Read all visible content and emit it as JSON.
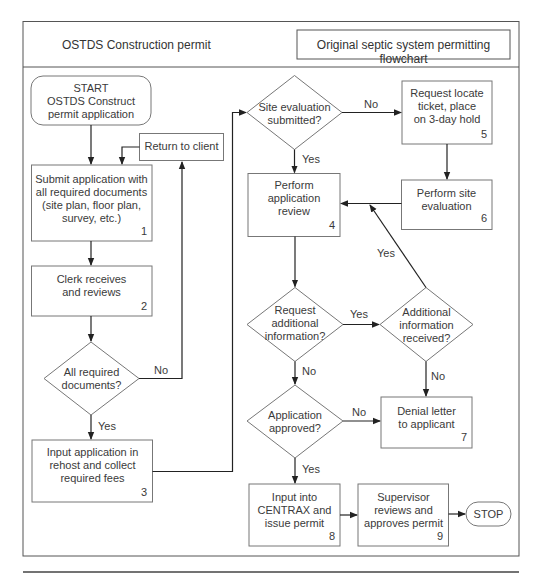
{
  "header": {
    "left_title": "OSTDS Construction permit",
    "right_title": "Original septic system permitting flowchart"
  },
  "nodes": {
    "start": {
      "shape": "terminator",
      "lines": [
        "START",
        "OSTDS Construct",
        "permit application"
      ]
    },
    "n1": {
      "shape": "process",
      "number": "1",
      "lines": [
        "Submit application with",
        "all required documents",
        "(site plan, floor plan,",
        "survey, etc.)"
      ]
    },
    "n2": {
      "shape": "process",
      "number": "2",
      "lines": [
        "Clerk receives",
        "and reviews"
      ]
    },
    "d_docs": {
      "shape": "decision",
      "lines": [
        "All required",
        "documents?"
      ]
    },
    "return": {
      "shape": "process",
      "lines": [
        "Return to client"
      ]
    },
    "n3": {
      "shape": "process",
      "number": "3",
      "lines": [
        "Input application in",
        "rehost and collect",
        "required fees"
      ]
    },
    "d_site": {
      "shape": "decision",
      "lines": [
        "Site evaluation",
        "submitted?"
      ]
    },
    "n5": {
      "shape": "process",
      "number": "5",
      "lines": [
        "Request locate",
        "ticket, place",
        "on 3-day hold"
      ]
    },
    "n6": {
      "shape": "process",
      "number": "6",
      "lines": [
        "Perform site",
        "evaluation"
      ]
    },
    "n4": {
      "shape": "process",
      "number": "4",
      "lines": [
        "Perform",
        "application",
        "review"
      ]
    },
    "d_request": {
      "shape": "decision",
      "lines": [
        "Request",
        "additional",
        "information?"
      ]
    },
    "d_received": {
      "shape": "decision",
      "lines": [
        "Additional",
        "information",
        "received?"
      ]
    },
    "d_approved": {
      "shape": "decision",
      "lines": [
        "Application",
        "approved?"
      ]
    },
    "n7": {
      "shape": "process",
      "number": "7",
      "lines": [
        "Denial letter",
        "to applicant"
      ]
    },
    "n8": {
      "shape": "process",
      "number": "8",
      "lines": [
        "Input into",
        "CENTRAX and",
        "issue permit"
      ]
    },
    "n9": {
      "shape": "process",
      "number": "9",
      "lines": [
        "Supervisor",
        "reviews and",
        "approves permit"
      ]
    },
    "stop": {
      "shape": "terminator",
      "lines": [
        "STOP"
      ]
    }
  },
  "edges": [
    {
      "from": "start",
      "to": "n1",
      "label": ""
    },
    {
      "from": "return",
      "to": "n1",
      "label": ""
    },
    {
      "from": "n1",
      "to": "n2",
      "label": ""
    },
    {
      "from": "n2",
      "to": "d_docs",
      "label": ""
    },
    {
      "from": "d_docs",
      "to": "return",
      "label": "No"
    },
    {
      "from": "d_docs",
      "to": "n3",
      "label": "Yes"
    },
    {
      "from": "n3",
      "to": "d_site",
      "label": ""
    },
    {
      "from": "d_site",
      "to": "n5",
      "label": "No"
    },
    {
      "from": "d_site",
      "to": "n4",
      "label": "Yes"
    },
    {
      "from": "n5",
      "to": "n6",
      "label": ""
    },
    {
      "from": "n6",
      "to": "n4",
      "label": ""
    },
    {
      "from": "n4",
      "to": "d_request",
      "label": ""
    },
    {
      "from": "d_request",
      "to": "d_received",
      "label": "Yes"
    },
    {
      "from": "d_received",
      "to": "n4",
      "label": "Yes"
    },
    {
      "from": "d_received",
      "to": "n7",
      "label": "No"
    },
    {
      "from": "d_request",
      "to": "d_approved",
      "label": "No"
    },
    {
      "from": "d_approved",
      "to": "n7",
      "label": "No"
    },
    {
      "from": "d_approved",
      "to": "n8",
      "label": "Yes"
    },
    {
      "from": "n8",
      "to": "n9",
      "label": ""
    },
    {
      "from": "n9",
      "to": "stop",
      "label": ""
    }
  ],
  "edge_labels": {
    "docs_no": "No",
    "docs_yes": "Yes",
    "site_no": "No",
    "site_yes": "Yes",
    "request_yes": "Yes",
    "received_yes": "Yes",
    "received_no": "No",
    "request_no": "No",
    "approved_no": "No",
    "approved_yes": "Yes"
  }
}
